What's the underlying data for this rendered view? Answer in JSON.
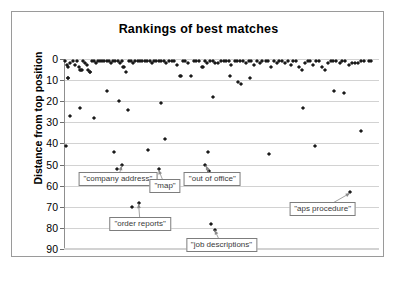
{
  "chart_data": {
    "type": "scatter",
    "title": "Rankings of best matches",
    "xlabel": "",
    "ylabel": "Distance from top position",
    "grid": true,
    "legend": false,
    "y_inverted": true,
    "ylim": [
      0,
      90
    ],
    "yticks": [
      0,
      10,
      20,
      30,
      40,
      50,
      60,
      70,
      80,
      90
    ],
    "xlim": [
      0,
      120
    ],
    "xticks": [],
    "marker": "diamond",
    "marker_color": "#1a1a1a",
    "points": [
      {
        "x": 0.4,
        "y": 1
      },
      {
        "x": 1.0,
        "y": 3
      },
      {
        "x": 1.4,
        "y": 4
      },
      {
        "x": 1.6,
        "y": 9
      },
      {
        "x": 2.4,
        "y": 2
      },
      {
        "x": 3.4,
        "y": 1
      },
      {
        "x": 4.2,
        "y": 3
      },
      {
        "x": 5.0,
        "y": 1
      },
      {
        "x": 5.6,
        "y": 4
      },
      {
        "x": 6.2,
        "y": 5
      },
      {
        "x": 6.6,
        "y": 5
      },
      {
        "x": 7.4,
        "y": 1
      },
      {
        "x": 8.0,
        "y": 2
      },
      {
        "x": 8.6,
        "y": 3
      },
      {
        "x": 9.2,
        "y": 5
      },
      {
        "x": 9.8,
        "y": 6
      },
      {
        "x": 10.6,
        "y": 1
      },
      {
        "x": 11.4,
        "y": 1
      },
      {
        "x": 12.2,
        "y": 2
      },
      {
        "x": 13.0,
        "y": 1
      },
      {
        "x": 13.8,
        "y": 1
      },
      {
        "x": 14.6,
        "y": 1
      },
      {
        "x": 15.4,
        "y": 1
      },
      {
        "x": 16.2,
        "y": 1
      },
      {
        "x": 17.0,
        "y": 1
      },
      {
        "x": 18.0,
        "y": 2
      },
      {
        "x": 18.8,
        "y": 1
      },
      {
        "x": 19.6,
        "y": 1
      },
      {
        "x": 20.6,
        "y": 1
      },
      {
        "x": 21.4,
        "y": 2
      },
      {
        "x": 22.2,
        "y": 1
      },
      {
        "x": 23.0,
        "y": 4
      },
      {
        "x": 23.6,
        "y": 6
      },
      {
        "x": 24.6,
        "y": 1
      },
      {
        "x": 25.4,
        "y": 1
      },
      {
        "x": 26.2,
        "y": 2
      },
      {
        "x": 27.2,
        "y": 1
      },
      {
        "x": 28.0,
        "y": 1
      },
      {
        "x": 29.0,
        "y": 1
      },
      {
        "x": 29.8,
        "y": 1
      },
      {
        "x": 30.8,
        "y": 1
      },
      {
        "x": 31.6,
        "y": 1
      },
      {
        "x": 32.6,
        "y": 1
      },
      {
        "x": 33.4,
        "y": 2
      },
      {
        "x": 34.4,
        "y": 1
      },
      {
        "x": 35.2,
        "y": 1
      },
      {
        "x": 36.2,
        "y": 1
      },
      {
        "x": 37.0,
        "y": 1
      },
      {
        "x": 38.0,
        "y": 1
      },
      {
        "x": 39.0,
        "y": 2
      },
      {
        "x": 40.0,
        "y": 1
      },
      {
        "x": 41.0,
        "y": 1
      },
      {
        "x": 42.0,
        "y": 1
      },
      {
        "x": 43.0,
        "y": 3
      },
      {
        "x": 44.0,
        "y": 8
      },
      {
        "x": 45.2,
        "y": 1
      },
      {
        "x": 46.2,
        "y": 1
      },
      {
        "x": 47.2,
        "y": 2
      },
      {
        "x": 48.4,
        "y": 8
      },
      {
        "x": 49.4,
        "y": 1
      },
      {
        "x": 50.4,
        "y": 1
      },
      {
        "x": 51.4,
        "y": 1
      },
      {
        "x": 52.4,
        "y": 4
      },
      {
        "x": 53.6,
        "y": 1
      },
      {
        "x": 54.6,
        "y": 2
      },
      {
        "x": 55.6,
        "y": 1
      },
      {
        "x": 56.6,
        "y": 1
      },
      {
        "x": 57.6,
        "y": 2
      },
      {
        "x": 58.6,
        "y": 2
      },
      {
        "x": 59.8,
        "y": 1
      },
      {
        "x": 60.8,
        "y": 1
      },
      {
        "x": 61.8,
        "y": 1
      },
      {
        "x": 62.8,
        "y": 1
      },
      {
        "x": 63.8,
        "y": 3
      },
      {
        "x": 65.0,
        "y": 1
      },
      {
        "x": 66.0,
        "y": 1
      },
      {
        "x": 67.0,
        "y": 1
      },
      {
        "x": 68.2,
        "y": 1
      },
      {
        "x": 69.2,
        "y": 2
      },
      {
        "x": 70.4,
        "y": 1
      },
      {
        "x": 71.4,
        "y": 1
      },
      {
        "x": 72.4,
        "y": 3
      },
      {
        "x": 73.6,
        "y": 1
      },
      {
        "x": 74.6,
        "y": 2
      },
      {
        "x": 75.6,
        "y": 1
      },
      {
        "x": 76.8,
        "y": 1
      },
      {
        "x": 77.8,
        "y": 1
      },
      {
        "x": 78.8,
        "y": 4
      },
      {
        "x": 80.0,
        "y": 1
      },
      {
        "x": 81.0,
        "y": 2
      },
      {
        "x": 82.0,
        "y": 1
      },
      {
        "x": 83.2,
        "y": 1
      },
      {
        "x": 84.2,
        "y": 2
      },
      {
        "x": 85.2,
        "y": 1
      },
      {
        "x": 86.4,
        "y": 3
      },
      {
        "x": 87.4,
        "y": 1
      },
      {
        "x": 88.4,
        "y": 1
      },
      {
        "x": 89.6,
        "y": 4
      },
      {
        "x": 90.6,
        "y": 5
      },
      {
        "x": 91.8,
        "y": 2
      },
      {
        "x": 92.8,
        "y": 1
      },
      {
        "x": 93.8,
        "y": 1
      },
      {
        "x": 95.0,
        "y": 3
      },
      {
        "x": 96.0,
        "y": 1
      },
      {
        "x": 97.2,
        "y": 1
      },
      {
        "x": 98.2,
        "y": 4
      },
      {
        "x": 99.4,
        "y": 5
      },
      {
        "x": 100.4,
        "y": 2
      },
      {
        "x": 101.6,
        "y": 1
      },
      {
        "x": 102.6,
        "y": 1
      },
      {
        "x": 103.8,
        "y": 1
      },
      {
        "x": 105.0,
        "y": 2
      },
      {
        "x": 106.0,
        "y": 1
      },
      {
        "x": 107.2,
        "y": 1
      },
      {
        "x": 108.4,
        "y": 3
      },
      {
        "x": 109.6,
        "y": 2
      },
      {
        "x": 110.8,
        "y": 2
      },
      {
        "x": 112.0,
        "y": 2
      },
      {
        "x": 113.2,
        "y": 1
      },
      {
        "x": 114.4,
        "y": 1
      },
      {
        "x": 116.0,
        "y": 1
      },
      {
        "x": 117.0,
        "y": 1
      },
      {
        "x": 1.5,
        "y": 9
      },
      {
        "x": 7.0,
        "y": 5
      },
      {
        "x": 10.0,
        "y": 6
      },
      {
        "x": 22.6,
        "y": 4
      },
      {
        "x": 44.6,
        "y": 8
      },
      {
        "x": 53.0,
        "y": 4
      },
      {
        "x": 63.2,
        "y": 8
      },
      {
        "x": 66.4,
        "y": 11
      },
      {
        "x": 67.6,
        "y": 12
      },
      {
        "x": 71.0,
        "y": 9
      },
      {
        "x": 2.2,
        "y": 27
      },
      {
        "x": 6.0,
        "y": 23
      },
      {
        "x": 11.6,
        "y": 28
      },
      {
        "x": 16.4,
        "y": 15
      },
      {
        "x": 21.0,
        "y": 20
      },
      {
        "x": 24.2,
        "y": 24
      },
      {
        "x": 36.8,
        "y": 21
      },
      {
        "x": 56.8,
        "y": 18
      },
      {
        "x": 91.0,
        "y": 23
      },
      {
        "x": 103.0,
        "y": 15
      },
      {
        "x": 106.6,
        "y": 16
      },
      {
        "x": 0.8,
        "y": 41
      },
      {
        "x": 19.0,
        "y": 44
      },
      {
        "x": 32.0,
        "y": 43
      },
      {
        "x": 38.4,
        "y": 38
      },
      {
        "x": 55.0,
        "y": 44
      },
      {
        "x": 78.0,
        "y": 45
      },
      {
        "x": 95.6,
        "y": 41
      },
      {
        "x": 113.0,
        "y": 34
      },
      {
        "x": 20.2,
        "y": 52
      },
      {
        "x": 22.0,
        "y": 50
      },
      {
        "x": 36.0,
        "y": 52
      },
      {
        "x": 53.8,
        "y": 50
      },
      {
        "x": 55.2,
        "y": 53
      },
      {
        "x": 26.0,
        "y": 70
      },
      {
        "x": 28.4,
        "y": 68
      },
      {
        "x": 56.0,
        "y": 78
      },
      {
        "x": 57.4,
        "y": 81
      },
      {
        "x": 109.0,
        "y": 63
      }
    ],
    "annotations": [
      {
        "label": "\"company address\"",
        "box_x": 20.5,
        "box_y": 57,
        "target_x": 22.0,
        "target_y": 50.5
      },
      {
        "label": "\"order reports\"",
        "box_x": 29.0,
        "box_y": 78,
        "target_x": 28.4,
        "target_y": 68.5
      },
      {
        "label": "\"map\"",
        "box_x": 38.5,
        "box_y": 60,
        "target_x": 36.0,
        "target_y": 52.5
      },
      {
        "label": "\"out of office\"",
        "box_x": 56.5,
        "box_y": 57,
        "target_x": 54.0,
        "target_y": 50.5
      },
      {
        "label": "\"job descriptions\"",
        "box_x": 60.0,
        "box_y": 88,
        "target_x": 57.4,
        "target_y": 81.0
      },
      {
        "label": "\"aps procedure\"",
        "box_x": 98.5,
        "box_y": 71,
        "target_x": 109.0,
        "target_y": 63.5
      }
    ]
  }
}
